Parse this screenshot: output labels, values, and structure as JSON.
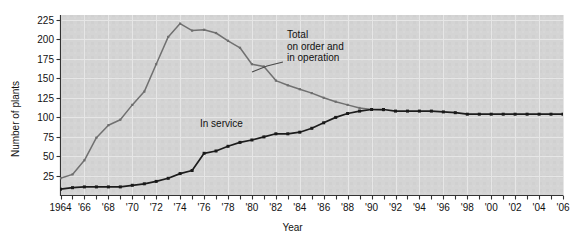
{
  "chart_data": {
    "type": "line",
    "title": "",
    "xlabel": "Year",
    "ylabel": "Number of plants",
    "xlim": [
      1964,
      2006
    ],
    "ylim": [
      0,
      231
    ],
    "grid": true,
    "legend_position": "inline-annotations",
    "y_ticks": [
      25,
      50,
      75,
      100,
      125,
      150,
      175,
      200,
      225
    ],
    "x_ticks": [
      1964,
      1965,
      1966,
      1967,
      1968,
      1969,
      1970,
      1971,
      1972,
      1973,
      1974,
      1975,
      1976,
      1977,
      1978,
      1979,
      1980,
      1981,
      1982,
      1983,
      1984,
      1985,
      1986,
      1987,
      1988,
      1989,
      1990,
      1991,
      1992,
      1993,
      1994,
      1995,
      1996,
      1997,
      1998,
      1999,
      2000,
      2001,
      2002,
      2003,
      2004,
      2005,
      2006
    ],
    "x_tick_labels": [
      "1964",
      "",
      "'66",
      "",
      "'68",
      "",
      "'70",
      "",
      "'72",
      "",
      "'74",
      "",
      "'76",
      "",
      "'78",
      "",
      "'80",
      "",
      "'82",
      "",
      "'84",
      "",
      "'86",
      "",
      "'88",
      "",
      "'90",
      "",
      "'92",
      "",
      "'94",
      "",
      "'96",
      "",
      "'98",
      "",
      "'00",
      "",
      "'02",
      "",
      "'04",
      "",
      "'06"
    ],
    "series": [
      {
        "name": "Total on order and in operation",
        "color": "#6e6e6e",
        "x": [
          1964,
          1965,
          1966,
          1967,
          1968,
          1969,
          1970,
          1971,
          1972,
          1973,
          1974,
          1975,
          1976,
          1977,
          1978,
          1979,
          1980,
          1981,
          1982,
          1983,
          1984,
          1985,
          1986,
          1987,
          1988,
          1989,
          1990,
          1991
        ],
        "values": [
          22,
          27,
          45,
          74,
          90,
          97,
          116,
          133,
          168,
          203,
          220,
          211,
          212,
          208,
          198,
          189,
          168,
          165,
          147,
          141,
          136,
          131,
          125,
          120,
          116,
          112,
          110,
          109
        ]
      },
      {
        "name": "In service",
        "color": "#1a1a1a",
        "x": [
          1964,
          1965,
          1966,
          1967,
          1968,
          1969,
          1970,
          1971,
          1972,
          1973,
          1974,
          1975,
          1976,
          1977,
          1978,
          1979,
          1980,
          1981,
          1982,
          1983,
          1984,
          1985,
          1986,
          1987,
          1988,
          1989,
          1990,
          1991,
          1992,
          1993,
          1994,
          1995,
          1996,
          1997,
          1998,
          1999,
          2000,
          2001,
          2002,
          2003,
          2004,
          2005,
          2006
        ],
        "values": [
          8,
          10,
          11,
          11,
          11,
          11,
          13,
          15,
          18,
          22,
          28,
          32,
          54,
          57,
          63,
          68,
          71,
          75,
          79,
          79,
          81,
          86,
          93,
          100,
          105,
          108,
          110,
          110,
          108,
          108,
          108,
          108,
          107,
          106,
          104,
          104,
          104,
          104,
          104,
          104,
          104,
          104,
          104
        ]
      }
    ],
    "annotations": [
      {
        "name": "total-label",
        "text_lines": [
          "Total",
          "on order and",
          "in operation"
        ],
        "x": 2.005,
        "y": 205
      },
      {
        "name": "in-service-label",
        "text_lines": [
          "In service"
        ],
        "x": 1980,
        "y": 122
      }
    ]
  },
  "labels": {
    "total_line1": "Total",
    "total_line2": "on order and",
    "total_line3": "in operation",
    "in_service": "In service",
    "y_axis_title": "Number of plants",
    "x_axis_title": "Year"
  },
  "colors": {
    "plot_background": "#d2d2d2",
    "grid": "#e4e4e4",
    "total_series": "#6e6e6e",
    "in_service_series": "#1a1a1a",
    "axis": "#222222",
    "page_background": "#ffffff"
  }
}
